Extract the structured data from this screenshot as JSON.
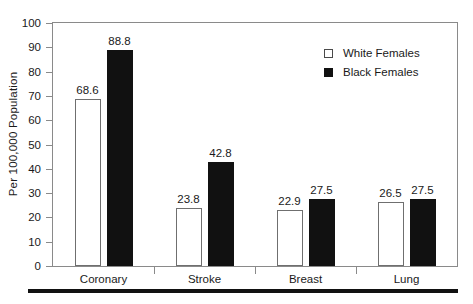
{
  "chart_data": {
    "type": "bar",
    "title": "",
    "xlabel": "",
    "ylabel": "Per 100,000 Population",
    "ylim": [
      0,
      100
    ],
    "ytick_step": 10,
    "yticks": [
      0,
      10,
      20,
      30,
      40,
      50,
      60,
      70,
      80,
      90,
      100
    ],
    "grid": false,
    "legend_position": "top-right",
    "categories": [
      "Coronary",
      "Stroke",
      "Breast",
      "Lung"
    ],
    "series": [
      {
        "name": "White Females",
        "color": "#ffffff",
        "edge_color": "#6f6f6f",
        "values": [
          68.6,
          23.8,
          22.9,
          26.5
        ],
        "labels": [
          "68.6",
          "23.8",
          "22.9",
          "26.5"
        ]
      },
      {
        "name": "Black Females",
        "color": "#111111",
        "edge_color": "#111111",
        "values": [
          88.8,
          42.8,
          27.5,
          27.5
        ],
        "labels": [
          "88.8",
          "42.8",
          "27.5",
          "27.5"
        ]
      }
    ]
  },
  "axis": {
    "y_title": "Per 100,000 Population",
    "tick_labels": [
      "100",
      "90",
      "80",
      "70",
      "60",
      "50",
      "40",
      "30",
      "20",
      "10",
      "0"
    ],
    "category_labels": [
      "Coronary",
      "Stroke",
      "Breast",
      "Lung"
    ]
  },
  "legend": {
    "items": [
      {
        "label": "White Females",
        "swatch": "open-square-swatch"
      },
      {
        "label": "Black Females",
        "swatch": "filled-square-swatch"
      }
    ]
  },
  "colors": {
    "white_series": "#ffffff",
    "black_series": "#111111",
    "axis": "#8a8a8a",
    "text": "#1a1a1a",
    "rule": "#111111"
  }
}
